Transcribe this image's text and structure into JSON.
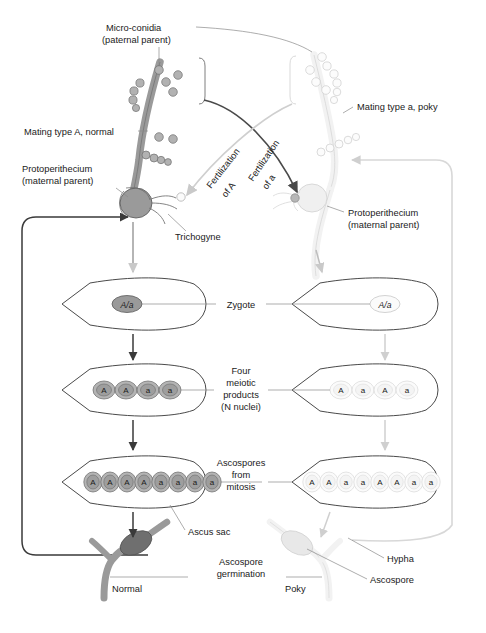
{
  "figure": {
    "type": "biological-diagram"
  },
  "palette": {
    "dark_outline": "#4a4a4a",
    "dark_fill": "#8e8e8e",
    "dark_spore": "#9a9a9a",
    "light_outline": "#d2d2d2",
    "light_fill": "#efefef",
    "light_spore": "#f4f4f4",
    "text": "#1a1a1a",
    "leader": "#8a8a8a",
    "loop_dark": "#3a3a3a",
    "loop_light": "#d8d8d8",
    "background": "#ffffff"
  },
  "labels": {
    "microconidia_l1": "Micro-conidia",
    "microconidia_l2": "(paternal parent)",
    "mating_type_A": "Mating type A, normal",
    "mating_type_a": "Mating type a, poky",
    "protoperithecium_left_l1": "Protoperithecium",
    "protoperithecium_left_l2": "(maternal parent)",
    "protoperithecium_right_l1": "Protoperithecium",
    "protoperithecium_right_l2": "(maternal parent)",
    "trichogyne": "Trichogyne",
    "fertilization_of_A_l1": "Fertilization",
    "fertilization_of_A_l2": "of A",
    "fertilization_of_a_l1": "Fertilization",
    "fertilization_of_a_l2": "of a",
    "zygote": "Zygote",
    "four_meiotic_l1": "Four",
    "four_meiotic_l2": "meiotic",
    "four_meiotic_l3": "products",
    "four_meiotic_l4": "(N nuclei)",
    "ascospores_l1": "Ascospores",
    "ascospores_l2": "from",
    "ascospores_l3": "mitosis",
    "ascus_sac": "Ascus sac",
    "ascospore_germination_l1": "Ascospore",
    "ascospore_germination_l2": "germination",
    "normal": "Normal",
    "poky": "Poky",
    "hypha": "Hypha",
    "ascospore": "Ascospore"
  },
  "stages": {
    "zygote": {
      "left_genotype": "A/a",
      "right_genotype": "A/a"
    },
    "meiotic_products": {
      "left_nuclei": [
        "A",
        "A",
        "a",
        "a"
      ],
      "right_nuclei": [
        "A",
        "a",
        "A",
        "a"
      ],
      "count_label": "N nuclei"
    },
    "ascospores": {
      "left_spores": [
        "A",
        "A",
        "A",
        "A",
        "a",
        "a",
        "a",
        "a"
      ],
      "right_spores": [
        "A",
        "A",
        "a",
        "a",
        "A",
        "A",
        "a",
        "a"
      ]
    }
  },
  "crosses": {
    "left": {
      "maternal": "Mating type A, normal",
      "paternal_source": "Micro-conidia of mating type a",
      "arrow_label": "Fertilization of a",
      "offspring_phenotype": "Normal"
    },
    "right": {
      "maternal": "Mating type a, poky",
      "paternal_source": "Micro-conidia of mating type A",
      "arrow_label": "Fertilization of A",
      "offspring_phenotype": "Poky"
    }
  },
  "microconidia": {
    "left_cluster_count": 13,
    "right_cluster_count": 13
  }
}
